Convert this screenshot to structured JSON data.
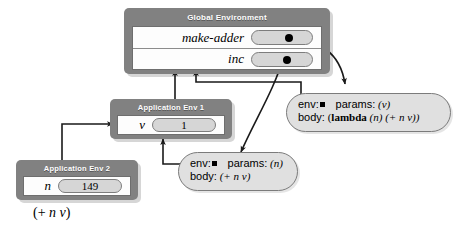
{
  "diagram": {
    "background_color": "#ffffff",
    "frame_color": "#818181",
    "pill_color": "#d6d6d6",
    "proc_color": "#e0e0e0"
  },
  "global_env": {
    "title": "Global Environment",
    "bindings": [
      {
        "name": "make-adder",
        "value": "",
        "has_pointer": true
      },
      {
        "name": "inc",
        "value": "",
        "has_pointer": true
      }
    ]
  },
  "app_env_1": {
    "title": "Application Env 1",
    "bindings": [
      {
        "name": "v",
        "value": "1",
        "has_pointer": false
      }
    ]
  },
  "app_env_2": {
    "title": "Application Env 2",
    "bindings": [
      {
        "name": "n",
        "value": "149",
        "has_pointer": false
      }
    ]
  },
  "procedure_make_adder": {
    "env_label": "env:",
    "params_label": "params:",
    "params_value": "(v)",
    "body_label": "body:",
    "body_keyword": "lambda",
    "body_prefix": "(",
    "body_rest": "(n) (+ n v))"
  },
  "procedure_inc": {
    "env_label": "env:",
    "params_label": "params:",
    "params_value": "(n)",
    "body_label": "body:",
    "body_value": "(+ n v)"
  },
  "expression": {
    "text": "(+ n v)"
  }
}
